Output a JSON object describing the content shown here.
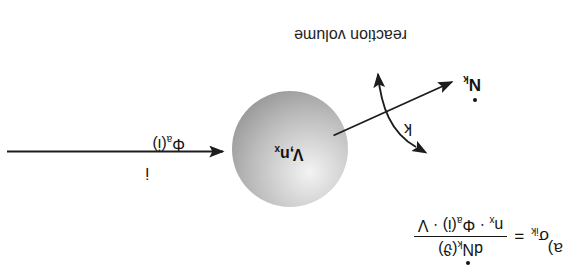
{
  "figure": {
    "panel_label": "a)",
    "caption": "reaction volume",
    "background_color": "#ffffff",
    "ink_color": "#141414"
  },
  "sphere": {
    "name": "reaction-volume-sphere",
    "label_volume": "V",
    "label_separator": ",",
    "label_density": "n",
    "label_density_sub": "x",
    "fill_style": "radial-gradient-gray",
    "edge_color": "#848484",
    "highlight_color": "#f3f3f3"
  },
  "incoming_flux": {
    "name": "activation-flux-arrow",
    "symbol": "Φ",
    "symbol_sub": "a",
    "argument": "(i)",
    "index_label": "i",
    "direction": "into-sphere"
  },
  "outgoing_rate": {
    "name": "reaction-rate-arrow",
    "symbol": "N",
    "symbol_sub": "k",
    "has_overdot": true,
    "direction": "out-of-sphere"
  },
  "rate_constant": {
    "name": "rate-constant-arrow",
    "label": "k",
    "style": "double-headed-curve"
  },
  "formula": {
    "lhs_symbol": "σ",
    "lhs_sub": "ik",
    "equals": "=",
    "numerator": {
      "prefix": "d",
      "symbol": "N",
      "symbol_sub": "k",
      "has_overdot": true,
      "argument": "(ϑ)"
    },
    "denominator": {
      "term1_symbol": "n",
      "term1_sub": "x",
      "dot1": "·",
      "term2_symbol": "Φ",
      "term2_sub": "a",
      "term2_arg": "(i)",
      "dot2": "·",
      "term3": "V"
    },
    "plain_text": "σ_ik = dṄ_k(ϑ) / (n_x · Φ_a(i) · V)"
  }
}
